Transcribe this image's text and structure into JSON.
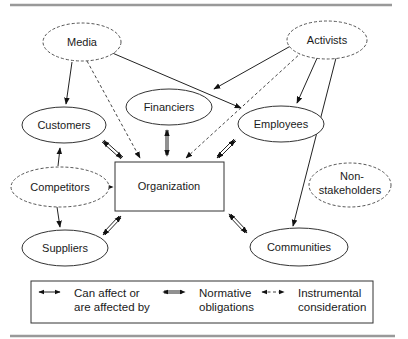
{
  "diagram": {
    "nodes": {
      "media": {
        "label": "Media",
        "style": "dashed"
      },
      "activists": {
        "label": "Activists",
        "style": "dashed"
      },
      "financiers": {
        "label": "Financiers",
        "style": "solid"
      },
      "customers": {
        "label": "Customers",
        "style": "solid"
      },
      "employees": {
        "label": "Employees",
        "style": "solid"
      },
      "competitors": {
        "label": "Competitors",
        "style": "dashed"
      },
      "organization": {
        "label": "Organization",
        "style": "box"
      },
      "nonstakeholders": {
        "label_line1": "Non-",
        "label_line2": "stakeholders",
        "style": "dashed"
      },
      "suppliers": {
        "label": "Suppliers",
        "style": "solid"
      },
      "communities": {
        "label": "Communities",
        "style": "solid"
      }
    },
    "edges": [
      {
        "from": "Media",
        "to": "Customers",
        "type": "can-affect"
      },
      {
        "from": "Media",
        "to": "Organization",
        "type": "instrumental"
      },
      {
        "from": "Media",
        "to": "Employees",
        "type": "can-affect"
      },
      {
        "from": "Activists",
        "to": "Customers",
        "type": "can-affect"
      },
      {
        "from": "Activists",
        "to": "Employees",
        "type": "can-affect"
      },
      {
        "from": "Activists",
        "to": "Organization",
        "type": "instrumental"
      },
      {
        "from": "Activists",
        "to": "Communities",
        "type": "can-affect"
      },
      {
        "from": "Customers",
        "to": "Organization",
        "type": "normative"
      },
      {
        "from": "Financiers",
        "to": "Organization",
        "type": "normative"
      },
      {
        "from": "Employees",
        "to": "Organization",
        "type": "normative"
      },
      {
        "from": "Competitors",
        "to": "Customers",
        "type": "can-affect"
      },
      {
        "from": "Competitors",
        "to": "Organization",
        "type": "instrumental"
      },
      {
        "from": "Competitors",
        "to": "Suppliers",
        "type": "can-affect"
      },
      {
        "from": "Suppliers",
        "to": "Organization",
        "type": "normative"
      },
      {
        "from": "Communities",
        "to": "Organization",
        "type": "normative"
      }
    ]
  },
  "legend": {
    "items": [
      {
        "symbol": "single-line-double-arrow",
        "line1": "Can affect or",
        "line2": "are affected by"
      },
      {
        "symbol": "double-line-double-arrow",
        "line1": "Normative",
        "line2": "obligations"
      },
      {
        "symbol": "dashed-double-arrow",
        "line1": "Instrumental",
        "line2": "consideration"
      }
    ]
  }
}
